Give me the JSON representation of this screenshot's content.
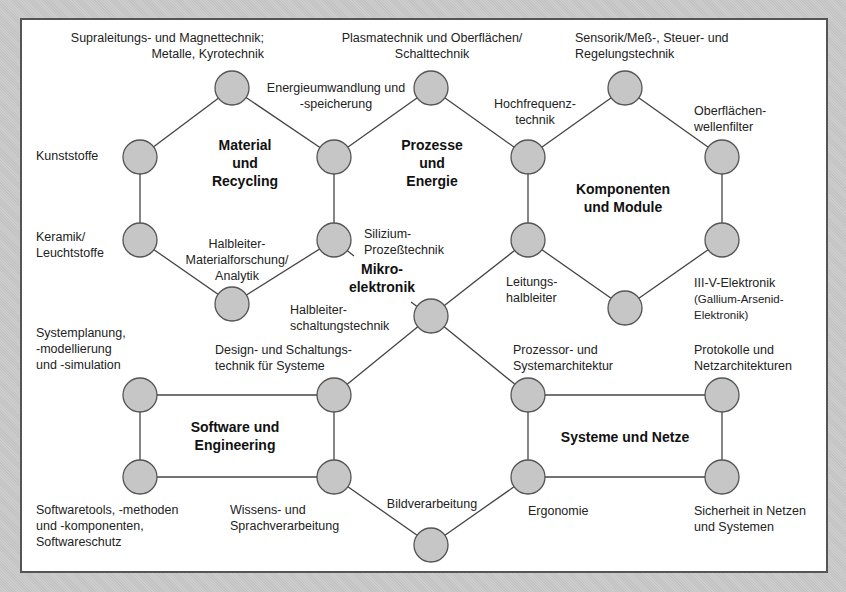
{
  "colors": {
    "node_fill": "#c6c6c6",
    "node_stroke": "#555555",
    "edge": "#444444",
    "frame_bg": "#ffffff",
    "outer_bg": "#c9c9c9"
  },
  "groups": {
    "material": [
      "Material",
      "und",
      "Recycling"
    ],
    "prozesse": [
      "Prozesse",
      "und",
      "Energie"
    ],
    "komponenten": [
      "Komponenten",
      "und Module"
    ],
    "mikro": [
      "Mikro-",
      "elektronik"
    ],
    "software": [
      "Software und",
      "Engineering"
    ],
    "systeme": [
      "Systeme und Netze"
    ]
  },
  "labels": {
    "supra": [
      "Supraleitungs- und Magnettechnik;",
      "Metalle, Kyrotechnik"
    ],
    "plasma": [
      "Plasmatechnik und Oberflächen/",
      "Schalttechnik"
    ],
    "sensorik": [
      "Sensorik/Meß-, Steuer- und",
      "Regelungstechnik"
    ],
    "energie": [
      "Energieumwandlung und",
      "-speicherung"
    ],
    "hochfrequenz": [
      "Hochfrequenz-",
      "technik"
    ],
    "oberflaechen": [
      "Oberflächen-",
      "wellenfilter"
    ],
    "kunststoffe": [
      "Kunststoffe"
    ],
    "keramik": [
      "Keramik/",
      "Leuchtstoffe"
    ],
    "halbleiter_material": [
      "Halbleiter-",
      "Materialforschung/",
      "Analytik"
    ],
    "silizium": [
      "Silizium-",
      "Prozeßtechnik"
    ],
    "leitungs": [
      "Leitungs-",
      "halbleiter"
    ],
    "iiiv": [
      "III-V-Elektronik",
      "(Gallium-Arsenid-",
      "Elektronik)"
    ],
    "halbleiter_schaltung": [
      "Halbleiter-",
      "schaltungstechnik"
    ],
    "systemplanung": [
      "Systemplanung,",
      "-modellierung",
      "und -simulation"
    ],
    "design": [
      "Design- und Schaltungs-",
      "technik für Systeme"
    ],
    "prozessor": [
      "Prozessor- und",
      "Systemarchitektur"
    ],
    "protokolle": [
      "Protokolle und",
      "Netzarchitekturen"
    ],
    "softwaretools": [
      "Softwaretools, -methoden",
      "und -komponenten,",
      "Softwareschutz"
    ],
    "wissens": [
      "Wissens- und",
      "Sprachverarbeitung"
    ],
    "bildverarbeitung": [
      "Bildverarbeitung"
    ],
    "ergonomie": [
      "Ergonomie"
    ],
    "sicherheit": [
      "Sicherheit in Netzen",
      "und Systemen"
    ]
  }
}
